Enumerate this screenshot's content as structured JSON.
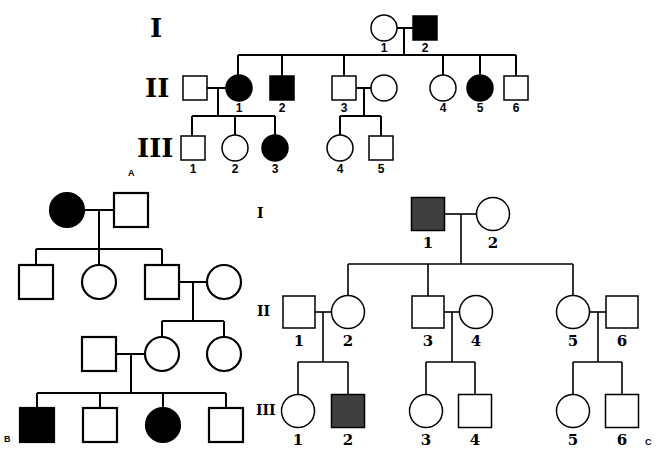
{
  "figure": {
    "colors": {
      "affected_a": "#000000",
      "affected_b": "#000000",
      "affected_c": "#3f3f3f",
      "unaffected": "#ffffff",
      "line": "#000000"
    }
  },
  "panels": [
    {
      "id": "A",
      "label": "A",
      "label_pos": [
        128,
        176
      ],
      "gen_class": "gen-a",
      "num_class": "num-a",
      "line_class": "line",
      "shape_class": "shape",
      "generation_labels": [
        {
          "text": "I",
          "x": 150,
          "y": 37
        },
        {
          "text": "II",
          "x": 145,
          "y": 97
        },
        {
          "text": "III",
          "x": 137,
          "y": 157
        }
      ],
      "individuals": [
        {
          "id": "A-I-1",
          "sex": "female",
          "affected": false,
          "cx": 384,
          "cy": 28,
          "s": 26,
          "num": "1",
          "nx": 384,
          "ny": 52
        },
        {
          "id": "A-I-2",
          "sex": "male",
          "affected": true,
          "cx": 425,
          "cy": 28,
          "s": 24,
          "num": "2",
          "nx": 425,
          "ny": 52
        },
        {
          "id": "A-II-spouse1",
          "sex": "male",
          "affected": false,
          "cx": 195,
          "cy": 88,
          "s": 24,
          "num": "",
          "nx": 0,
          "ny": 0
        },
        {
          "id": "A-II-1",
          "sex": "female",
          "affected": true,
          "cx": 239,
          "cy": 88,
          "s": 26,
          "num": "1",
          "nx": 239,
          "ny": 112
        },
        {
          "id": "A-II-2",
          "sex": "male",
          "affected": true,
          "cx": 282,
          "cy": 88,
          "s": 24,
          "num": "2",
          "nx": 282,
          "ny": 112
        },
        {
          "id": "A-II-3",
          "sex": "male",
          "affected": false,
          "cx": 344,
          "cy": 88,
          "s": 24,
          "num": "3",
          "nx": 344,
          "ny": 112
        },
        {
          "id": "A-II-spouse3",
          "sex": "female",
          "affected": false,
          "cx": 384,
          "cy": 88,
          "s": 26,
          "num": "",
          "nx": 0,
          "ny": 0
        },
        {
          "id": "A-II-4",
          "sex": "female",
          "affected": false,
          "cx": 443,
          "cy": 88,
          "s": 26,
          "num": "4",
          "nx": 443,
          "ny": 112
        },
        {
          "id": "A-II-5",
          "sex": "female",
          "affected": true,
          "cx": 480,
          "cy": 88,
          "s": 26,
          "num": "5",
          "nx": 480,
          "ny": 112
        },
        {
          "id": "A-II-6",
          "sex": "male",
          "affected": false,
          "cx": 516,
          "cy": 88,
          "s": 24,
          "num": "6",
          "nx": 516,
          "ny": 112
        },
        {
          "id": "A-III-1",
          "sex": "male",
          "affected": false,
          "cx": 193,
          "cy": 148,
          "s": 24,
          "num": "1",
          "nx": 193,
          "ny": 173
        },
        {
          "id": "A-III-2",
          "sex": "female",
          "affected": false,
          "cx": 235,
          "cy": 148,
          "s": 26,
          "num": "2",
          "nx": 235,
          "ny": 173
        },
        {
          "id": "A-III-3",
          "sex": "female",
          "affected": true,
          "cx": 275,
          "cy": 148,
          "s": 26,
          "num": "3",
          "nx": 275,
          "ny": 173
        },
        {
          "id": "A-III-4",
          "sex": "female",
          "affected": false,
          "cx": 340,
          "cy": 148,
          "s": 26,
          "num": "4",
          "nx": 340,
          "ny": 173
        },
        {
          "id": "A-III-5",
          "sex": "male",
          "affected": false,
          "cx": 381,
          "cy": 148,
          "s": 24,
          "num": "5",
          "nx": 381,
          "ny": 173
        }
      ],
      "lines": [
        [
          397,
          28,
          413,
          28
        ],
        [
          404,
          28,
          404,
          55
        ],
        [
          238,
          55,
          516,
          55
        ],
        [
          238,
          55,
          238,
          75
        ],
        [
          282,
          55,
          282,
          76
        ],
        [
          344,
          55,
          344,
          76
        ],
        [
          443,
          55,
          443,
          75
        ],
        [
          480,
          55,
          480,
          75
        ],
        [
          516,
          55,
          516,
          76
        ],
        [
          207,
          88,
          226,
          88
        ],
        [
          218,
          88,
          218,
          116
        ],
        [
          192,
          116,
          275,
          116
        ],
        [
          192,
          116,
          192,
          136
        ],
        [
          235,
          116,
          235,
          135
        ],
        [
          275,
          116,
          275,
          135
        ],
        [
          356,
          88,
          371,
          88
        ],
        [
          364,
          88,
          364,
          116
        ],
        [
          340,
          116,
          381,
          116
        ],
        [
          340,
          116,
          340,
          135
        ],
        [
          381,
          116,
          381,
          136
        ]
      ]
    },
    {
      "id": "B",
      "label": "B",
      "label_pos": [
        4,
        442
      ],
      "gen_class": "gen-a",
      "num_class": "num-a",
      "line_class": "line",
      "shape_class": "shape-b",
      "generation_labels": [],
      "individuals": [
        {
          "id": "B-I-1",
          "sex": "female",
          "affected": true,
          "cx": 67,
          "cy": 210,
          "s": 34,
          "num": "",
          "nx": 0,
          "ny": 0
        },
        {
          "id": "B-I-2",
          "sex": "male",
          "affected": false,
          "cx": 131,
          "cy": 210,
          "s": 34,
          "num": "",
          "nx": 0,
          "ny": 0
        },
        {
          "id": "B-II-1",
          "sex": "male",
          "affected": false,
          "cx": 36,
          "cy": 282,
          "s": 34,
          "num": "",
          "nx": 0,
          "ny": 0
        },
        {
          "id": "B-II-2",
          "sex": "female",
          "affected": false,
          "cx": 99,
          "cy": 282,
          "s": 34,
          "num": "",
          "nx": 0,
          "ny": 0
        },
        {
          "id": "B-II-3",
          "sex": "male",
          "affected": false,
          "cx": 162,
          "cy": 282,
          "s": 34,
          "num": "",
          "nx": 0,
          "ny": 0
        },
        {
          "id": "B-II-spouse",
          "sex": "female",
          "affected": false,
          "cx": 224,
          "cy": 282,
          "s": 34,
          "num": "",
          "nx": 0,
          "ny": 0
        },
        {
          "id": "B-III-spouse",
          "sex": "male",
          "affected": false,
          "cx": 99,
          "cy": 354,
          "s": 34,
          "num": "",
          "nx": 0,
          "ny": 0
        },
        {
          "id": "B-III-1",
          "sex": "female",
          "affected": false,
          "cx": 162,
          "cy": 354,
          "s": 34,
          "num": "",
          "nx": 0,
          "ny": 0
        },
        {
          "id": "B-III-2",
          "sex": "female",
          "affected": false,
          "cx": 224,
          "cy": 354,
          "s": 34,
          "num": "",
          "nx": 0,
          "ny": 0
        },
        {
          "id": "B-IV-1",
          "sex": "male",
          "affected": true,
          "cx": 37,
          "cy": 425,
          "s": 34,
          "num": "",
          "nx": 0,
          "ny": 0
        },
        {
          "id": "B-IV-2",
          "sex": "male",
          "affected": false,
          "cx": 100,
          "cy": 425,
          "s": 34,
          "num": "",
          "nx": 0,
          "ny": 0
        },
        {
          "id": "B-IV-3",
          "sex": "female",
          "affected": true,
          "cx": 163,
          "cy": 425,
          "s": 34,
          "num": "",
          "nx": 0,
          "ny": 0
        },
        {
          "id": "B-IV-4",
          "sex": "male",
          "affected": false,
          "cx": 226,
          "cy": 425,
          "s": 34,
          "num": "",
          "nx": 0,
          "ny": 0
        }
      ],
      "lines": [
        [
          84,
          210,
          114,
          210
        ],
        [
          99,
          210,
          99,
          249
        ],
        [
          36,
          249,
          162,
          249
        ],
        [
          36,
          249,
          36,
          265
        ],
        [
          99,
          249,
          99,
          265
        ],
        [
          162,
          249,
          162,
          265
        ],
        [
          179,
          282,
          207,
          282
        ],
        [
          193,
          282,
          193,
          321
        ],
        [
          162,
          321,
          224,
          321
        ],
        [
          162,
          321,
          162,
          337
        ],
        [
          224,
          321,
          224,
          337
        ],
        [
          116,
          354,
          145,
          354
        ],
        [
          131,
          354,
          131,
          393
        ],
        [
          37,
          393,
          226,
          393
        ],
        [
          37,
          393,
          37,
          408
        ],
        [
          100,
          393,
          100,
          408
        ],
        [
          163,
          393,
          163,
          408
        ],
        [
          226,
          393,
          226,
          408
        ]
      ]
    },
    {
      "id": "C",
      "label": "C",
      "label_pos": [
        645,
        445
      ],
      "gen_class": "gen-c",
      "num_class": "num-c",
      "line_class": "line-c",
      "shape_class": "shape",
      "generation_labels": [
        {
          "text": "I",
          "x": 257,
          "y": 218
        },
        {
          "text": "II",
          "x": 257,
          "y": 316
        },
        {
          "text": "III",
          "x": 256,
          "y": 415
        }
      ],
      "individuals": [
        {
          "id": "C-I-1",
          "sex": "male",
          "affected": true,
          "cx": 428,
          "cy": 214,
          "s": 33,
          "num": "1",
          "nx": 428,
          "ny": 248
        },
        {
          "id": "C-I-2",
          "sex": "female",
          "affected": false,
          "cx": 493,
          "cy": 214,
          "s": 33,
          "num": "2",
          "nx": 493,
          "ny": 248
        },
        {
          "id": "C-II-1",
          "sex": "male",
          "affected": false,
          "cx": 299,
          "cy": 312,
          "s": 32,
          "num": "1",
          "nx": 299,
          "ny": 346
        },
        {
          "id": "C-II-2",
          "sex": "female",
          "affected": false,
          "cx": 348,
          "cy": 312,
          "s": 33,
          "num": "2",
          "nx": 348,
          "ny": 346
        },
        {
          "id": "C-II-3",
          "sex": "male",
          "affected": false,
          "cx": 428,
          "cy": 312,
          "s": 32,
          "num": "3",
          "nx": 428,
          "ny": 346
        },
        {
          "id": "C-II-4",
          "sex": "female",
          "affected": false,
          "cx": 476,
          "cy": 312,
          "s": 33,
          "num": "4",
          "nx": 476,
          "ny": 346
        },
        {
          "id": "C-II-5",
          "sex": "female",
          "affected": false,
          "cx": 573,
          "cy": 312,
          "s": 33,
          "num": "5",
          "nx": 573,
          "ny": 346
        },
        {
          "id": "C-II-6",
          "sex": "male",
          "affected": false,
          "cx": 622,
          "cy": 312,
          "s": 32,
          "num": "6",
          "nx": 622,
          "ny": 346
        },
        {
          "id": "C-III-1",
          "sex": "female",
          "affected": false,
          "cx": 298,
          "cy": 411,
          "s": 33,
          "num": "1",
          "nx": 298,
          "ny": 445
        },
        {
          "id": "C-III-2",
          "sex": "male",
          "affected": true,
          "cx": 348,
          "cy": 411,
          "s": 33,
          "num": "2",
          "nx": 348,
          "ny": 445
        },
        {
          "id": "C-III-3",
          "sex": "female",
          "affected": false,
          "cx": 426,
          "cy": 411,
          "s": 33,
          "num": "3",
          "nx": 426,
          "ny": 445
        },
        {
          "id": "C-III-4",
          "sex": "male",
          "affected": false,
          "cx": 475,
          "cy": 411,
          "s": 33,
          "num": "4",
          "nx": 475,
          "ny": 445
        },
        {
          "id": "C-III-5",
          "sex": "female",
          "affected": false,
          "cx": 573,
          "cy": 411,
          "s": 33,
          "num": "5",
          "nx": 573,
          "ny": 445
        },
        {
          "id": "C-III-6",
          "sex": "male",
          "affected": false,
          "cx": 622,
          "cy": 411,
          "s": 33,
          "num": "6",
          "nx": 622,
          "ny": 445
        }
      ],
      "lines": [
        [
          445,
          214,
          477,
          214
        ],
        [
          461,
          214,
          461,
          264
        ],
        [
          348,
          264,
          573,
          264
        ],
        [
          348,
          264,
          348,
          296
        ],
        [
          428,
          264,
          428,
          296
        ],
        [
          573,
          264,
          573,
          296
        ],
        [
          315,
          312,
          332,
          312
        ],
        [
          323,
          312,
          323,
          362
        ],
        [
          298,
          362,
          348,
          362
        ],
        [
          298,
          362,
          298,
          395
        ],
        [
          348,
          362,
          348,
          395
        ],
        [
          444,
          312,
          460,
          312
        ],
        [
          452,
          312,
          452,
          362
        ],
        [
          426,
          362,
          475,
          362
        ],
        [
          426,
          362,
          426,
          395
        ],
        [
          475,
          362,
          475,
          395
        ],
        [
          590,
          312,
          606,
          312
        ],
        [
          598,
          312,
          598,
          362
        ],
        [
          573,
          362,
          622,
          362
        ],
        [
          573,
          362,
          573,
          395
        ],
        [
          622,
          362,
          622,
          395
        ]
      ]
    }
  ]
}
